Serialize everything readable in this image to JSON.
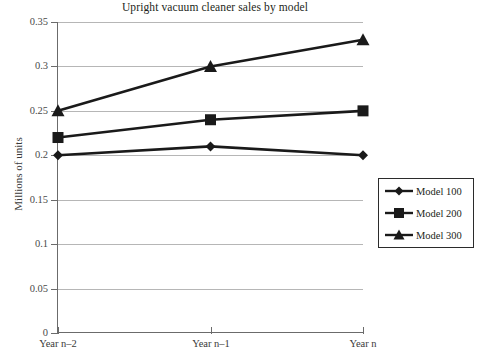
{
  "chart_data": {
    "type": "line",
    "title": "Upright vacuum cleaner sales by model",
    "xlabel": "",
    "ylabel": "Millions of units",
    "categories": [
      "Year n–2",
      "Year n–1",
      "Year n"
    ],
    "ylim": [
      0,
      0.35
    ],
    "yticks": [
      "0",
      "0.05",
      "0.1",
      "0.15",
      "0.2",
      "0.25",
      "0.3",
      "0.35"
    ],
    "ytick_values": [
      0,
      0.05,
      0.1,
      0.15,
      0.2,
      0.25,
      0.3,
      0.35
    ],
    "grid": true,
    "legend_position": "right",
    "series": [
      {
        "name": "Model 100",
        "marker": "diamond",
        "values": [
          0.2,
          0.21,
          0.2
        ],
        "color": "#1a1a1a"
      },
      {
        "name": "Model 200",
        "marker": "square",
        "values": [
          0.22,
          0.24,
          0.25
        ],
        "color": "#1a1a1a"
      },
      {
        "name": "Model 300",
        "marker": "triangle",
        "values": [
          0.25,
          0.3,
          0.33
        ],
        "color": "#1a1a1a"
      }
    ]
  },
  "axis": {
    "y_title": "Millions of units"
  },
  "legend": {
    "items": [
      {
        "label": "Model 100",
        "marker": "diamond-marker"
      },
      {
        "label": "Model 200",
        "marker": "square-marker"
      },
      {
        "label": "Model 300",
        "marker": "triangle-marker"
      }
    ]
  },
  "colors": {
    "series": "#1a1a1a",
    "gridline": "#b6b6b6",
    "axis": "#6b6b6b",
    "text": "#231f20",
    "background": "#ffffff"
  }
}
